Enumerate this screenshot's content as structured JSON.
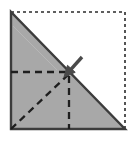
{
  "figure": {
    "type": "origami-fold-diagram",
    "canvas": {
      "width": 135,
      "height": 142
    },
    "colors": {
      "paper_fill": "#a8a8a8",
      "background": "#ffffff",
      "outline": "#3c3c3c",
      "crease": "#1e1e1e",
      "arrow": "#4a4a4a",
      "ghost_outline": "#2b2b2b"
    },
    "square": {
      "label": "paper-square-outline",
      "style": "dotted",
      "left": 11,
      "top": 12,
      "right": 125,
      "bottom": 129
    },
    "folded_triangle": {
      "label": "folded-gray-triangle",
      "fill": "#a8a8a8",
      "points": "11,12 11,129 125,129"
    },
    "creases": [
      {
        "name": "horizontal-crease",
        "style": "dashed",
        "x1": 11,
        "y1": 72,
        "x2": 69,
        "y2": 72
      },
      {
        "name": "vertical-crease",
        "style": "dashed",
        "x1": 69,
        "y1": 76,
        "x2": 69,
        "y2": 129
      },
      {
        "name": "diagonal-crease",
        "style": "dashed",
        "x1": 11,
        "y1": 129,
        "x2": 70,
        "y2": 73
      }
    ],
    "arrow": {
      "name": "fold-direction-arrow",
      "direction": "down-left",
      "x1": 82,
      "y1": 57,
      "x2": 64,
      "y2": 77
    }
  }
}
